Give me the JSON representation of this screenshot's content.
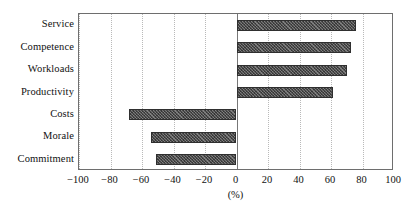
{
  "chart_data": {
    "type": "bar",
    "orientation": "horizontal",
    "title": "",
    "subtitle": "",
    "xlabel": "(%)",
    "ylabel": "",
    "categories": [
      "Service",
      "Competence",
      "Workloads",
      "Productivity",
      "Costs",
      "Morale",
      "Commitment"
    ],
    "values": [
      76,
      73,
      70,
      61,
      -68,
      -54,
      -51
    ],
    "series": [
      {
        "name": "Change",
        "values": [
          76,
          73,
          70,
          61,
          -68,
          -54,
          -51
        ]
      }
    ],
    "xlim": [
      -100,
      100
    ],
    "xticks": [
      -100,
      -80,
      -60,
      -40,
      -20,
      0,
      20,
      40,
      60,
      80,
      100
    ],
    "xtick_labels": [
      "−100",
      "−80",
      "−60",
      "−40",
      "−20",
      "0",
      "20",
      "40",
      "60",
      "80",
      "100"
    ],
    "grid": true,
    "grid_axis": "x",
    "grid_style": "dotted",
    "legend": false,
    "legend_position": "none",
    "zero_line": true,
    "bar_fill": "#4b4b4b",
    "bar_edge": "#2f2f2f",
    "bar_hatch": "crosshatch",
    "frame_color": "#6e6e6e",
    "grid_color": "#b9b9b9",
    "background": "#ffffff",
    "text_color": "#111111",
    "annotations": []
  }
}
